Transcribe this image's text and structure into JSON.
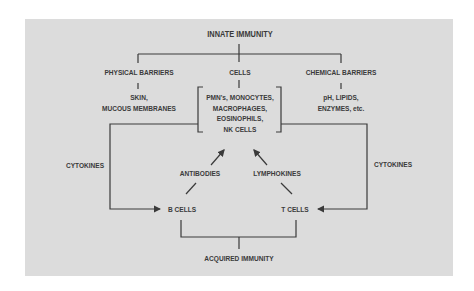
{
  "diagram": {
    "top": "INNATE IMMUNITY",
    "branches": [
      {
        "label": "PHYSICAL BARRIERS",
        "detail": [
          "SKIN,",
          "MUCOUS MEMBRANES"
        ]
      },
      {
        "label": "CELLS",
        "detail": [
          "PMN's, MONOCYTES,",
          "MACROPHAGES,",
          "EOSINOPHILS,",
          "NK CELLS"
        ]
      },
      {
        "label": "CHEMICAL BARRIERS",
        "detail": [
          "pH, LIPIDS,",
          "ENZYMES, etc."
        ]
      }
    ],
    "left_loop": "CYTOKINES",
    "right_loop": "CYTOKINES",
    "antibodies": "ANTIBODIES",
    "lymphokines": "LYMPHOKINES",
    "b_cells": "B CELLS",
    "t_cells": "T CELLS",
    "bottom": "ACQUIRED IMMUNITY"
  },
  "colors": {
    "panel": "#dcdcdc",
    "line": "#3a3a3a",
    "background": "#ffffff"
  }
}
